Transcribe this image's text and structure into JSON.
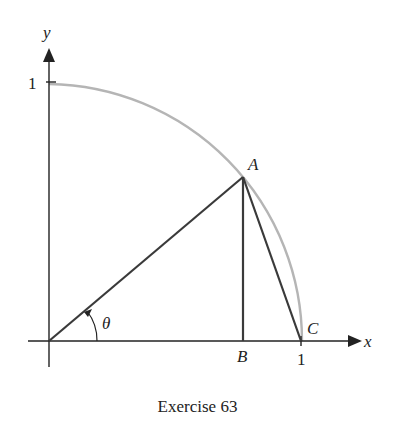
{
  "figure": {
    "caption": "Exercise 63",
    "axes": {
      "x_label": "x",
      "y_label": "y",
      "x_tick_label": "1",
      "y_tick_label": "1"
    },
    "points": {
      "A": "A",
      "B": "B",
      "C": "C"
    },
    "angle_label": "θ",
    "colors": {
      "arc": "#b5b5b5",
      "lines": "#3a3a3a",
      "axes": "#222222"
    },
    "elements": [
      "quarter unit circle arc from (0,1) to (1,0)",
      "segment O-A (radius at angle θ)",
      "segment A-B (vertical, perpendicular to x-axis)",
      "segment A-C (chord)",
      "angle θ arc with arrow at origin"
    ]
  }
}
